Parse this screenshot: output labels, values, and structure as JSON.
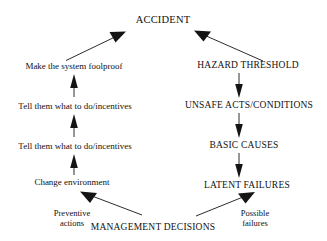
{
  "diagram": {
    "background_color": "#ffffff",
    "ink_color": "#111111",
    "nodes": {
      "accident": "ACCIDENT",
      "hazard_threshold": "HAZARD THRESHOLD",
      "unsafe_acts": "UNSAFE ACTS/CONDITIONS",
      "basic_causes": "BASIC CAUSES",
      "latent_failures": "LATENT FAILURES",
      "management_decisions": "MANAGEMENT DECISIONS",
      "make_foolproof": "Make the system foolproof",
      "tell_them_1": "Tell them what to do/incentives",
      "tell_them_2": "Tell them what to do/incentives",
      "change_environment": "Change environment",
      "preventive_actions_line1": "Preventive",
      "preventive_actions_line2": "actions",
      "possible_failures_line1": "Possible",
      "possible_failures_line2": "failures"
    },
    "edges": [
      {
        "name": "foolproof-to-accident",
        "from": "make_foolproof",
        "to": "accident",
        "style": "diagonal-up-right"
      },
      {
        "name": "hazard-to-accident",
        "from": "hazard_threshold",
        "to": "accident",
        "style": "diagonal-up-left"
      },
      {
        "name": "tell1-to-foolproof",
        "from": "tell_them_1",
        "to": "make_foolproof",
        "style": "vertical-up"
      },
      {
        "name": "tell2-to-tell1",
        "from": "tell_them_2",
        "to": "tell_them_1",
        "style": "vertical-up"
      },
      {
        "name": "change-to-tell2",
        "from": "change_environment",
        "to": "tell_them_2",
        "style": "vertical-up"
      },
      {
        "name": "management-to-change",
        "from": "management_decisions",
        "to": "change_environment",
        "style": "diagonal-up-left"
      },
      {
        "name": "management-to-latent",
        "from": "management_decisions",
        "to": "latent_failures",
        "style": "diagonal-up-right"
      },
      {
        "name": "hazard-to-unsafe",
        "from": "hazard_threshold",
        "to": "unsafe_acts",
        "style": "vertical-down"
      },
      {
        "name": "unsafe-to-basic",
        "from": "unsafe_acts",
        "to": "basic_causes",
        "style": "vertical-down"
      },
      {
        "name": "basic-to-latent",
        "from": "basic_causes",
        "to": "latent_failures",
        "style": "vertical-down"
      }
    ]
  }
}
